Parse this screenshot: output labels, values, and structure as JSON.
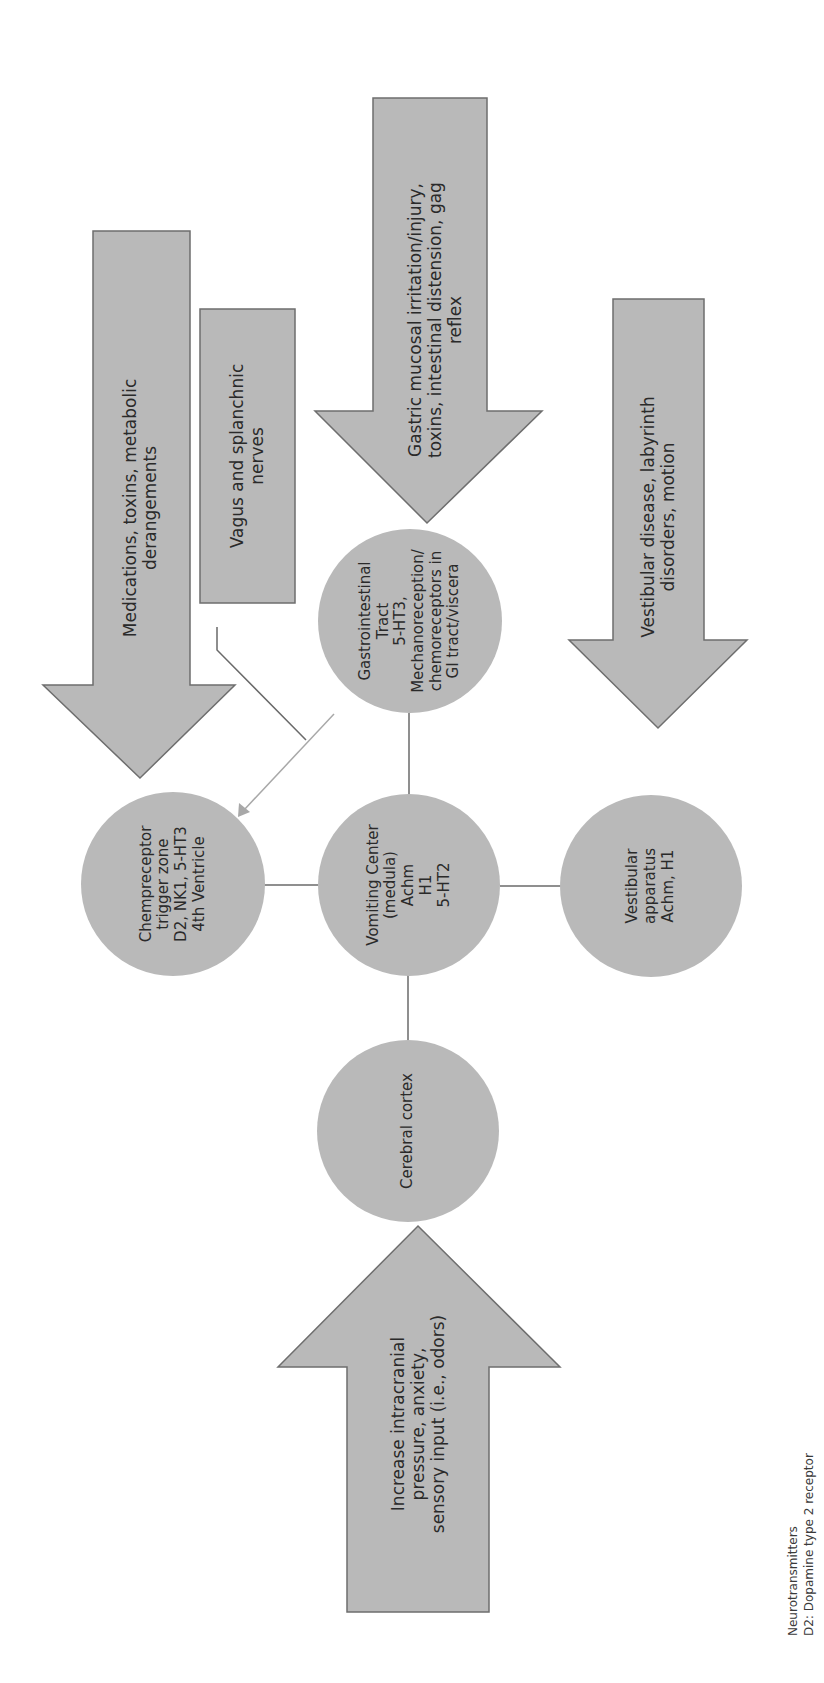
{
  "diagram": {
    "orientation": "rotated -90deg",
    "colors": {
      "shape_fill": "#b9b9b9",
      "shape_stroke": "#6e6e6e",
      "connector": "#6a6a6a",
      "connector_light": "#a8a8a8",
      "text": "#2a2a2a"
    },
    "nodes": {
      "vomiting_center": {
        "lines": [
          "Vomiting Center",
          "(medula)",
          "Achm",
          "H1",
          "5-HT2"
        ]
      },
      "chemoreceptor_trigger_zone": {
        "lines": [
          "Chempreceptor",
          "trigger zone",
          "D2, NK1, 5-HT3",
          "4th Ventricle"
        ]
      },
      "gastrointestinal_tract": {
        "lines": [
          "Gastrointestinal",
          "Tract",
          "5-HT3,",
          "Mechanoreception/",
          "chemoreceptors in",
          "GI tract/viscera"
        ]
      },
      "vestibular_apparatus": {
        "lines": [
          "Vestibular",
          "apparatus",
          "Achm, H1"
        ]
      },
      "cerebral_cortex": {
        "lines": [
          "Cerebral cortex"
        ]
      }
    },
    "inputs": {
      "medications": {
        "lines": [
          "Medications, toxins, metabolic",
          "derangements"
        ]
      },
      "vagus": {
        "lines": [
          "Vagus and splanchnic",
          "nerves"
        ]
      },
      "gastric": {
        "lines": [
          "Gastric mucosal irritation/injury,",
          "toxins, intestinal distension, gag",
          "reflex"
        ]
      },
      "vestibular_disease": {
        "lines": [
          "Vestibular disease, labyrinth",
          "disorders, motion"
        ]
      },
      "intracranial": {
        "lines": [
          "Increase intracranial",
          "pressure, anxiety,",
          "sensory input (i.e., odors)"
        ]
      }
    },
    "legend": {
      "title": "Neurotransmitters",
      "items": [
        "D2: Dopamine type 2 receptor"
      ]
    }
  }
}
